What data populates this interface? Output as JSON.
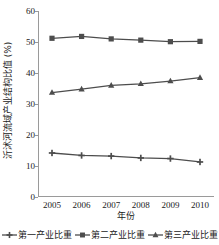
{
  "chart_data": {
    "type": "line",
    "title": "",
    "xlabel": "年份",
    "ylabel": "沂沭河流域产业结构比值 (%)",
    "categories": [
      "2005",
      "2006",
      "2007",
      "2008",
      "2009",
      "2010"
    ],
    "x": [
      2005,
      2006,
      2007,
      2008,
      2009,
      2010
    ],
    "xlim": [
      2004.6,
      2010.4
    ],
    "ylim": [
      0,
      60
    ],
    "yticks": [
      0,
      10,
      20,
      30,
      40,
      50,
      60
    ],
    "grid": false,
    "legend_position": "bottom",
    "series": [
      {
        "name": "第一产业比重",
        "marker": "plus",
        "color": "#4d4d4d",
        "values": [
          14.2,
          13.4,
          13.2,
          12.6,
          12.4,
          11.3
        ]
      },
      {
        "name": "第二产业比重",
        "marker": "square",
        "color": "#4d4d4d",
        "values": [
          51.2,
          51.8,
          51.0,
          50.6,
          50.1,
          50.2
        ]
      },
      {
        "name": "第三产业比重",
        "marker": "triangle",
        "color": "#4d4d4d",
        "values": [
          33.7,
          34.8,
          36.0,
          36.5,
          37.4,
          38.5
        ]
      }
    ]
  },
  "axis": {
    "y_tick_labels": [
      "0",
      "10",
      "20",
      "30",
      "40",
      "50",
      "60"
    ],
    "x_tick_labels": [
      "2005",
      "2006",
      "2007",
      "2008",
      "2009",
      "2010"
    ],
    "y_title": "沂沭河流域产业结构比值 (%)",
    "x_title": "年份"
  },
  "legend": {
    "entries": [
      {
        "label": "第一产业比重"
      },
      {
        "label": "第二产业比重"
      },
      {
        "label": "第三产业比重"
      }
    ]
  },
  "colors": {
    "line": "#4d4d4d",
    "axis": "#9a9a9a",
    "text": "#1a1a1a",
    "background": "#ffffff"
  }
}
